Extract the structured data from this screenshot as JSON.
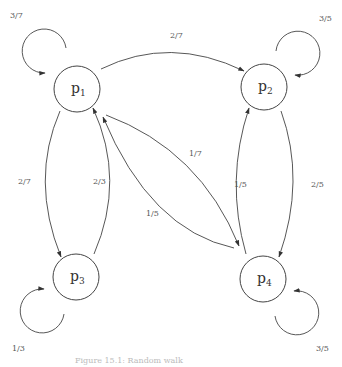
{
  "diagram": {
    "type": "markov-chain",
    "nodes": [
      {
        "id": "p1",
        "base": "p",
        "sub": "1",
        "cx": 77,
        "cy": 89
      },
      {
        "id": "p2",
        "base": "p",
        "sub": "2",
        "cx": 264,
        "cy": 87
      },
      {
        "id": "p3",
        "base": "p",
        "sub": "3",
        "cx": 76,
        "cy": 277
      },
      {
        "id": "p4",
        "base": "p",
        "sub": "4",
        "cx": 263,
        "cy": 279
      }
    ],
    "edges": [
      {
        "from": "p1",
        "to": "p1",
        "label": "3/7"
      },
      {
        "from": "p1",
        "to": "p2",
        "label": "2/7"
      },
      {
        "from": "p1",
        "to": "p3",
        "label": "2/7"
      },
      {
        "from": "p3",
        "to": "p1",
        "label": "2/3"
      },
      {
        "from": "p1",
        "to": "p4",
        "label": "1/7"
      },
      {
        "from": "p4",
        "to": "p1",
        "label": "1/5"
      },
      {
        "from": "p2",
        "to": "p2",
        "label": "3/5"
      },
      {
        "from": "p2",
        "to": "p4",
        "label": "2/5"
      },
      {
        "from": "p4",
        "to": "p2",
        "label": "1/5"
      },
      {
        "from": "p3",
        "to": "p3",
        "label": "1/3"
      },
      {
        "from": "p4",
        "to": "p4",
        "label": "3/5"
      }
    ]
  },
  "labels": {
    "p1_base": "p",
    "p1_sub": "1",
    "p2_base": "p",
    "p2_sub": "2",
    "p3_base": "p",
    "p3_sub": "3",
    "p4_base": "p",
    "p4_sub": "4",
    "p1_self": "3/7",
    "p1_p2": "2/7",
    "p1_p3": "2/7",
    "p3_p1": "2/3",
    "p1_p4": "1/7",
    "p4_p1": "1/5",
    "p2_self": "3/5",
    "p2_p4": "2/5",
    "p4_p2": "1/5",
    "p3_self": "1/3",
    "p4_self": "3/5"
  },
  "caption": "Figure 15.1: Random walk"
}
